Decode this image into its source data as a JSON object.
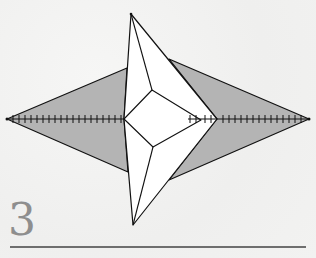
{
  "diagram": {
    "step": {
      "number": "3"
    },
    "colors": {
      "background": "#f3f3f2",
      "shaded_paper": "#b4b4b4",
      "white_paper": "#ffffff",
      "line": "#111111",
      "step_number": "#8e8e8e",
      "rule": "#6e6e6e"
    },
    "elements": [
      {
        "name": "left-shaded-flap",
        "type": "polygon",
        "fill": "shaded"
      },
      {
        "name": "right-shaded-flap",
        "type": "polygon",
        "fill": "shaded"
      },
      {
        "name": "center-white-kite",
        "type": "polygon",
        "fill": "white"
      },
      {
        "name": "inner-square",
        "type": "polygon",
        "fill": "white"
      },
      {
        "name": "horizontal-crease-with-tick-marks",
        "type": "line"
      }
    ]
  }
}
